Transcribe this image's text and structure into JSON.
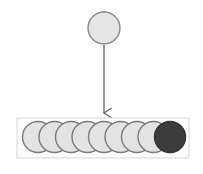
{
  "diagram": {
    "source_node": {
      "cx": 104,
      "cy": 28,
      "r": 16,
      "fill": "#e6e6e6",
      "stroke": "#8a8a8a"
    },
    "arrow": {
      "x": 104,
      "y1": 45,
      "y2": 113,
      "color": "#6e6e6e"
    },
    "container": {
      "x": 17,
      "y": 118,
      "width": 172,
      "height": 40,
      "stroke": "#d8d8d8",
      "fill": "#fcfcfc"
    },
    "queue": {
      "count": 9,
      "cy": 137,
      "r": 15.5,
      "start_cx": 38,
      "spacing": 16.5,
      "light_fill": "#e3e3e3",
      "light_stroke": "#7a7a7a",
      "dark_fill": "#3c3c3c",
      "dark_stroke": "#333333",
      "items": [
        {
          "state": "light"
        },
        {
          "state": "light"
        },
        {
          "state": "light"
        },
        {
          "state": "light"
        },
        {
          "state": "light"
        },
        {
          "state": "light"
        },
        {
          "state": "light"
        },
        {
          "state": "light"
        },
        {
          "state": "dark"
        }
      ]
    }
  }
}
